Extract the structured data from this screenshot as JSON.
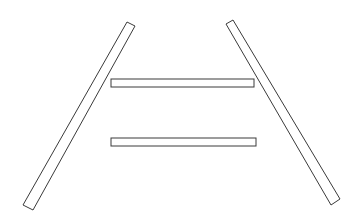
{
  "diagram": {
    "canvas": {
      "width": 356,
      "height": 219,
      "background": "#ffffff"
    },
    "stroke_color": "#3a3a3a",
    "bars": [
      {
        "id": "left-slanted-bar",
        "points": "127,22 135,26 33,210 23,205"
      },
      {
        "id": "right-slanted-bar",
        "points": "226,24 233,20 340,199 331,205"
      },
      {
        "id": "upper-horizontal-bar",
        "x": 111,
        "y": 79,
        "width": 143,
        "height": 8
      },
      {
        "id": "lower-horizontal-bar",
        "x": 111,
        "y": 138,
        "width": 145,
        "height": 8
      }
    ]
  }
}
